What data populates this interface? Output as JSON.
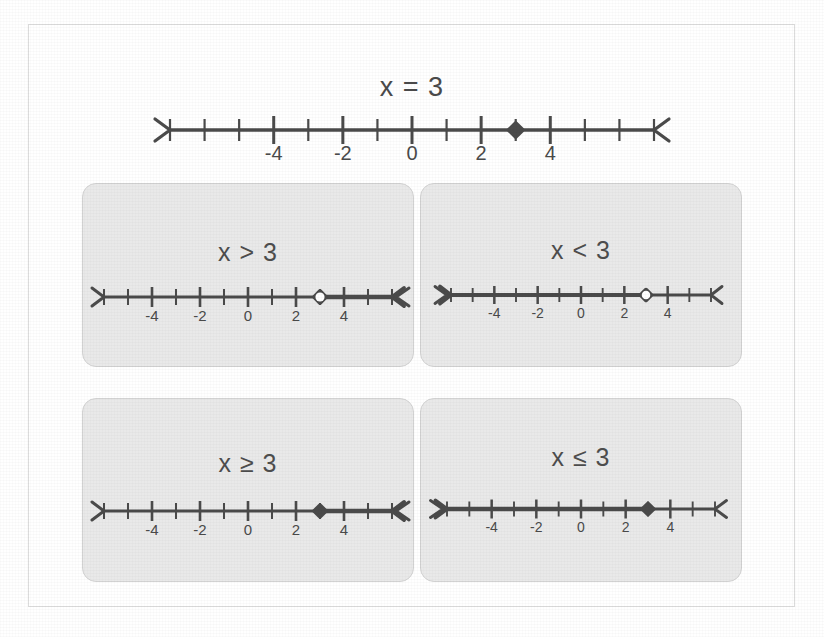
{
  "page": {
    "background_color": "#ffffff",
    "border_color": "#dcdcdc",
    "ink_color": "#4a4a4a",
    "panel_fill": "#e9e9e9",
    "panel_border": "#d2d2d2"
  },
  "headline": {
    "title": "x = 3",
    "numberline": {
      "min": -7,
      "max": 7,
      "labeled_ticks": [
        -4,
        -2,
        0,
        2,
        4
      ],
      "left_arrow": true,
      "right_arrow": true,
      "point_value": 3,
      "point_style": "closed",
      "shaded_direction": "none"
    }
  },
  "panels": [
    {
      "id": "greater-than",
      "title": "x > 3",
      "numberline": {
        "min": -6,
        "max": 6,
        "labeled_ticks": [
          -4,
          -2,
          0,
          2,
          4
        ],
        "left_arrow": true,
        "right_arrow": true,
        "point_value": 3,
        "point_style": "open",
        "shaded_direction": "right"
      }
    },
    {
      "id": "less-than",
      "title": "x < 3",
      "numberline": {
        "min": -6,
        "max": 6,
        "labeled_ticks": [
          -4,
          -2,
          0,
          2,
          4
        ],
        "left_arrow": true,
        "right_arrow": true,
        "point_value": 3,
        "point_style": "open",
        "shaded_direction": "left"
      }
    },
    {
      "id": "greater-or-equal",
      "title": "x ≥ 3",
      "numberline": {
        "min": -6,
        "max": 6,
        "labeled_ticks": [
          -4,
          -2,
          0,
          2,
          4
        ],
        "left_arrow": true,
        "right_arrow": true,
        "point_value": 3,
        "point_style": "closed",
        "shaded_direction": "right"
      }
    },
    {
      "id": "less-or-equal",
      "title": "x ≤ 3",
      "numberline": {
        "min": -6,
        "max": 6,
        "labeled_ticks": [
          -4,
          -2,
          0,
          2,
          4
        ],
        "left_arrow": true,
        "right_arrow": true,
        "point_value": 3,
        "point_style": "closed",
        "shaded_direction": "left"
      }
    }
  ],
  "chart_data": {
    "type": "line",
    "xlabel": "",
    "ylabel": "",
    "series": [
      {
        "name": "x = 3",
        "xlim": [
          -7,
          7
        ],
        "tick_labels": [
          "-4",
          "-2",
          "0",
          "2",
          "4"
        ],
        "tick_values": [
          -4,
          -2,
          0,
          2,
          4
        ],
        "point": 3,
        "point_style": "closed",
        "ray": "none"
      },
      {
        "name": "x > 3",
        "xlim": [
          -6,
          6
        ],
        "tick_labels": [
          "-4",
          "-2",
          "0",
          "2",
          "4"
        ],
        "tick_values": [
          -4,
          -2,
          0,
          2,
          4
        ],
        "point": 3,
        "point_style": "open",
        "ray": "right"
      },
      {
        "name": "x < 3",
        "xlim": [
          -6,
          6
        ],
        "tick_labels": [
          "-4",
          "-2",
          "0",
          "2",
          "4"
        ],
        "tick_values": [
          -4,
          -2,
          0,
          2,
          4
        ],
        "point": 3,
        "point_style": "open",
        "ray": "left"
      },
      {
        "name": "x ≥ 3",
        "xlim": [
          -6,
          6
        ],
        "tick_labels": [
          "-4",
          "-2",
          "0",
          "2",
          "4"
        ],
        "tick_values": [
          -4,
          -2,
          0,
          2,
          4
        ],
        "point": 3,
        "point_style": "closed",
        "ray": "right"
      },
      {
        "name": "x ≤ 3",
        "xlim": [
          -6,
          6
        ],
        "tick_labels": [
          "-4",
          "-2",
          "0",
          "2",
          "4"
        ],
        "tick_values": [
          -4,
          -2,
          0,
          2,
          4
        ],
        "point": 3,
        "point_style": "closed",
        "ray": "left"
      }
    ]
  }
}
